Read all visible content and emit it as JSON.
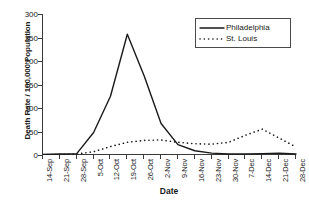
{
  "chart_data": {
    "type": "line",
    "title": "",
    "xlabel": "Date",
    "ylabel": "Death Rate / 100,000 Population",
    "ylim": [
      0,
      300
    ],
    "ytick_step": 50,
    "yticks": [
      0,
      50,
      100,
      150,
      200,
      250,
      300
    ],
    "grid": false,
    "legend_position": "top-right",
    "categories": [
      "14-Sep",
      "21-Sep",
      "28-Sep",
      "5-Oct",
      "12-Oct",
      "19-Oct",
      "26-Oct",
      "2-Nov",
      "9-Nov",
      "16-Nov",
      "23-Nov",
      "30-Nov",
      "7-Dec",
      "14-Dec",
      "21-Dec",
      "28-Dec"
    ],
    "series": [
      {
        "name": "Philadelphia",
        "style": "solid",
        "color": "#1a1a1a",
        "values": [
          1,
          2,
          3,
          48,
          125,
          257,
          168,
          67,
          22,
          9,
          4,
          2,
          2,
          3,
          4,
          2
        ]
      },
      {
        "name": "St. Louis",
        "style": "dotted",
        "color": "#1a1a1a",
        "values": [
          1,
          1,
          2,
          7,
          18,
          27,
          31,
          32,
          27,
          24,
          23,
          27,
          42,
          55,
          36,
          17
        ]
      }
    ]
  },
  "legend": {
    "entries": [
      {
        "label": "Philadelphia",
        "style": "solid"
      },
      {
        "label": "St. Louis",
        "style": "dotted"
      }
    ]
  }
}
